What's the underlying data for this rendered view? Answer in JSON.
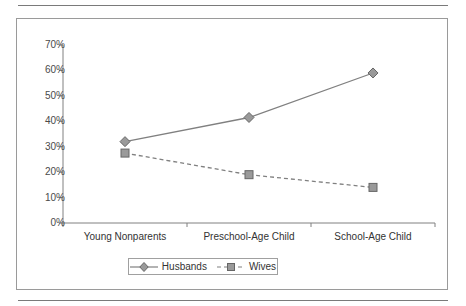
{
  "chart_data": {
    "type": "line",
    "title": "",
    "subtitle": "",
    "xlabel": "",
    "ylabel": "",
    "categories": [
      "Young Nonparents",
      "Preschool-Age Child",
      "School-Age Child"
    ],
    "series": [
      {
        "name": "Husbands",
        "values": [
          32,
          41.5,
          59
        ],
        "marker": "diamond",
        "line_style": "solid",
        "color": "#808080"
      },
      {
        "name": "Wives",
        "values": [
          27.5,
          19,
          14
        ],
        "marker": "square",
        "line_style": "dashed",
        "color": "#808080"
      }
    ],
    "ylim": [
      0,
      70
    ],
    "ytick_values": [
      0,
      10,
      20,
      30,
      40,
      50,
      60,
      70
    ],
    "ytick_labels": [
      "0%",
      "10%",
      "20%",
      "30%",
      "40%",
      "50%",
      "60%",
      "70%"
    ],
    "grid": false,
    "legend_position": "bottom",
    "legend_entries": [
      "Husbands",
      "Wives"
    ],
    "value_suffix": "%"
  },
  "axes": {
    "y_axis_name": "percent-axis",
    "x_axis_name": "family-stage-axis"
  },
  "colors": {
    "line": "#808080",
    "marker_fill": "#9a9a9a",
    "marker_stroke": "#666666",
    "axis": "#808080",
    "frame": "#9a9a9a",
    "rule": "#7a7a7a",
    "text": "#333333",
    "tick_text": "#4a4a4a"
  }
}
